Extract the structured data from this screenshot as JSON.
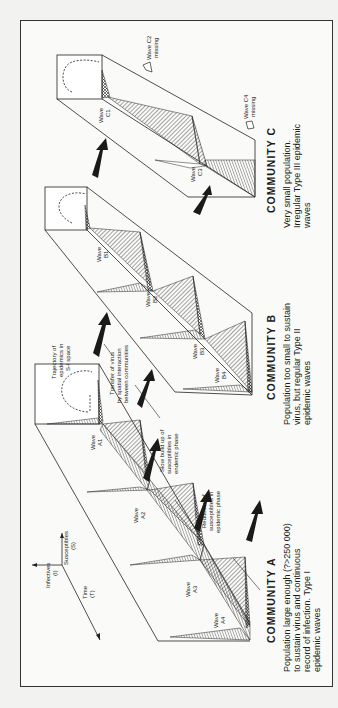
{
  "figure": {
    "orientation": "rotated 90deg counter-clockwise",
    "axes": {
      "infectives": "Infectives",
      "infectives_sym": "(I)",
      "susceptibles": "Susceptibles",
      "susceptibles_sym": "(S)",
      "time": "Time",
      "time_sym": "(T)"
    },
    "annotations": {
      "trajectory_1": "Trajectory of",
      "trajectory_2": "epidemics in",
      "trajectory_3": "S-I space",
      "transfer_1": "Transfer of virus",
      "transfer_2": "by spatial interaction",
      "transfer_3": "between communities",
      "buildup_1": "Slow build up of",
      "buildup_2": "susceptibles in",
      "buildup_3": "endemic phase",
      "reduction_1": "Reduction of",
      "reduction_2": "susceptibles in",
      "reduction_3": "epidemic phase"
    },
    "communities": [
      {
        "title": "COMMUNITY A",
        "desc_1": "Population large enough (?>250 000)",
        "desc_2": "to sustain virus and continuous",
        "desc_3": "record of infection. Type I",
        "desc_4": "epidemic waves",
        "waves": [
          "A1",
          "A2",
          "A3",
          "A4"
        ]
      },
      {
        "title": "COMMUNITY B",
        "desc_1": "Population too small to sustain",
        "desc_2": "virus, but regular Type II",
        "desc_3": "epidemic waves",
        "waves": [
          "B1",
          "B2",
          "B3",
          "B4"
        ]
      },
      {
        "title": "COMMUNITY C",
        "desc_1": "Very small population.",
        "desc_2": "Irregular Type III epidemic",
        "desc_3": "waves",
        "waves": [
          "C1",
          "C3"
        ],
        "missing_1": "Wave C2",
        "missing_1b": "missing",
        "missing_2": "Wave C4",
        "missing_2b": "missing"
      }
    ],
    "wave_word": "Wave"
  }
}
